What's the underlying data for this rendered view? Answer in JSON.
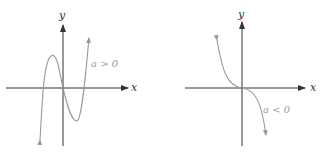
{
  "graphs": [
    {
      "id": "left",
      "x_label": "x",
      "y_label": "y",
      "condition": "a > 0",
      "curve": "cubic with local max and local min, three real roots"
    },
    {
      "id": "right",
      "x_label": "x",
      "y_label": "y",
      "condition": "a < 0",
      "curve": "decreasing cubic with inflection at origin"
    }
  ],
  "colors": {
    "axis": "#333333",
    "curve": "#999999",
    "label": "#999999"
  }
}
